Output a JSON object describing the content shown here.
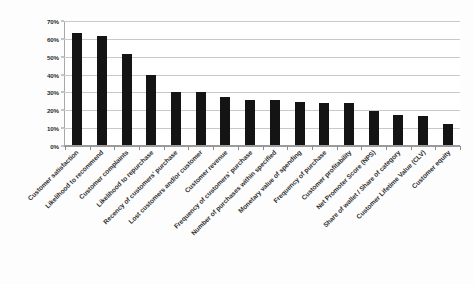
{
  "chart_data": {
    "type": "bar",
    "title": "",
    "subtitle": "",
    "xlabel": "",
    "ylabel": "",
    "ylim": [
      0,
      70
    ],
    "y_unit": "%",
    "grid": true,
    "legend": null,
    "legend_position": "none",
    "bar_color": "#141414",
    "gridline_color": "#c9c9c9",
    "axis_color": "#9a9a9a",
    "yticks": [
      "0%",
      "10%",
      "20%",
      "30%",
      "40%",
      "50%",
      "60%",
      "70%"
    ],
    "ytick_values": [
      0,
      10,
      20,
      30,
      40,
      50,
      60,
      70
    ],
    "categories": [
      "Customer satisfaction",
      "Likelihood to recommend",
      "Customer complaints",
      "Likelihood to repurchase",
      "Recency of customers' purchase",
      "Lost customers and/or customer",
      "Customer revenue",
      "Frequency of customers' purchase",
      "Number of purchases within specified",
      "Monetary value of spending",
      "Frequency of purchase",
      "Customer profitability",
      "Net Promoter Score (NPS)",
      "Share of wallet / Share of category",
      "Customer Lifetime Value (CLV)",
      "Customer equity"
    ],
    "values": [
      63,
      61,
      51,
      39,
      29.5,
      29.5,
      27,
      25,
      25,
      24,
      23.5,
      23.5,
      19,
      17,
      16.5,
      12
    ]
  }
}
